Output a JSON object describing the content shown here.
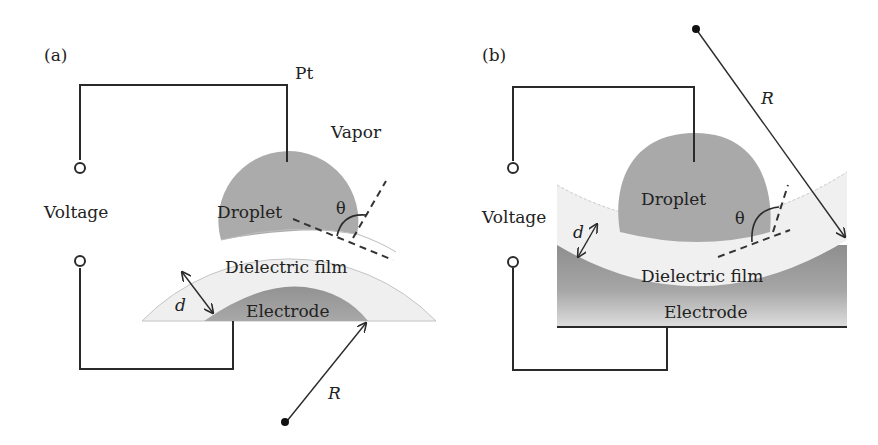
{
  "figure": {
    "type": "electrowetting schematic",
    "colors": {
      "wire": "#2a2a2a",
      "droplet": "#a9a9a9",
      "droplet_a": "#ababab",
      "dielectric": "#eeeeee",
      "electrode": "#9a9a9a",
      "electrode_light": "#d9d9d9",
      "outline": "#c8c8c8",
      "text": "#222222"
    }
  },
  "panel_a": {
    "label": "(a)",
    "pt_label": "Pt",
    "vapor_label": "Vapor",
    "voltage_label": "Voltage",
    "droplet_label": "Droplet",
    "theta_label": "θ",
    "dielectric_label": "Dielectric film",
    "electrode_label": "Electrode",
    "thickness_label": "d",
    "radius_label": "R"
  },
  "panel_b": {
    "label": "(b)",
    "voltage_label": "Voltage",
    "droplet_label": "Droplet",
    "theta_label": "θ",
    "dielectric_label": "Dielectric film",
    "electrode_label": "Electrode",
    "thickness_label": "d",
    "radius_label": "R"
  }
}
